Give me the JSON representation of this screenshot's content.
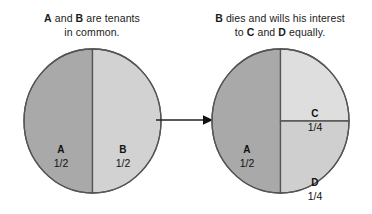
{
  "diagram": {
    "arrow": {
      "name": "transition-arrow",
      "direction": "right"
    },
    "colors": {
      "slice_dark": "#a9a9a9",
      "slice_light": "#d2d2d2",
      "slice_lightest": "#dedede",
      "slice_mid": "#cfcfcf",
      "outline": "#555555",
      "text": "#1a1a1a",
      "background": "#ffffff"
    },
    "panels": [
      {
        "id": "before",
        "caption_parts": [
          {
            "text": "A",
            "bold": true
          },
          {
            "text": " and ",
            "bold": false
          },
          {
            "text": "B",
            "bold": true
          },
          {
            "text": " are tenants",
            "bold": false
          },
          {
            "text": "in common.",
            "bold": false,
            "newline": true
          }
        ],
        "caption_line1": "A and B are tenants",
        "caption_line2": "in common.",
        "slices": [
          {
            "name": "A",
            "share": "1/2",
            "fraction": 0.5,
            "fill": "#a9a9a9",
            "position": "left-half"
          },
          {
            "name": "B",
            "share": "1/2",
            "fraction": 0.5,
            "fill": "#d2d2d2",
            "position": "right-half"
          }
        ]
      },
      {
        "id": "after",
        "caption_line1": "B dies and wills his interest",
        "caption_line2": "to C and D equally.",
        "slices": [
          {
            "name": "A",
            "share": "1/2",
            "fraction": 0.5,
            "fill": "#a9a9a9",
            "position": "left-half"
          },
          {
            "name": "C",
            "share": "1/4",
            "fraction": 0.25,
            "fill": "#dedede",
            "position": "upper-right-quarter"
          },
          {
            "name": "D",
            "share": "1/4",
            "fraction": 0.25,
            "fill": "#cfcfcf",
            "position": "lower-right-quarter"
          }
        ]
      }
    ]
  }
}
